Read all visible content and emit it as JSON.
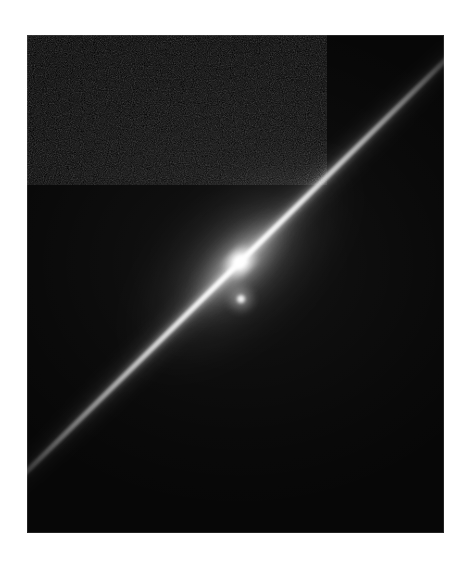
{
  "figure": {
    "kind": "astronomical-image",
    "modality": "grayscale broadband optical image",
    "background_color": "#ffffff",
    "frame": {
      "x": 27,
      "y": 35,
      "width": 417,
      "height": 498,
      "sky_background_color": "#070707",
      "border_color": "#969696"
    }
  },
  "chart_data": {
    "type": "heatmap",
    "title": "",
    "subtitle": "",
    "xlabel": "",
    "ylabel": "",
    "grid": false,
    "legend": null,
    "colormap": "grayscale",
    "value_range": [
      0,
      255
    ],
    "axis_ranges": {
      "x": [
        0,
        417
      ],
      "y": [
        0,
        498
      ]
    },
    "features": [
      {
        "name": "galaxy-disk",
        "label": "Edge-on disk",
        "shape": "linear streak",
        "position_angle_deg": 44.5,
        "center_x_pct": 51.1,
        "center_y_pct": 45.6,
        "length_px": 690,
        "thickness_px": 5,
        "peak_brightness": 255,
        "extends_to": "frame corners (lower-left to upper-right)"
      },
      {
        "name": "galaxy-bulge",
        "label": "Central bulge",
        "shape": "elongated ellipse",
        "center_x_pct": 51.1,
        "center_y_pct": 45.6,
        "major_axis_px": 300,
        "minor_axis_px": 150,
        "peak_brightness": 200
      },
      {
        "name": "galaxy-nucleus",
        "label": "Nucleus",
        "shape": "saturated point",
        "center_x_pct": 51.1,
        "center_y_pct": 45.6,
        "diameter_px": 13,
        "peak_brightness": 255
      },
      {
        "name": "point-source",
        "label": "Compact point source",
        "shape": "unresolved point",
        "center_x_pct": 51.3,
        "center_y_pct": 53.0,
        "diameter_px": 9,
        "peak_brightness": 235,
        "offset_from_nucleus_px": 37
      },
      {
        "name": "sky-background",
        "label": "Sky background",
        "shape": "uniform field",
        "mean_brightness": 10,
        "noise": "fine pixel grain"
      }
    ]
  }
}
